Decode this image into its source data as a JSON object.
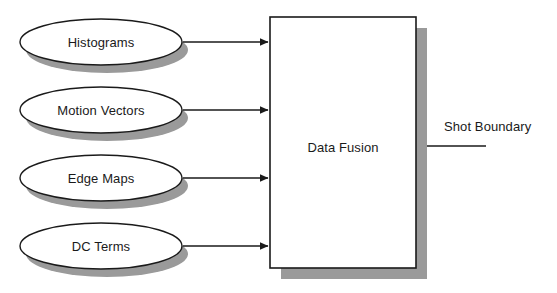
{
  "diagram": {
    "type": "flow-diagram",
    "background_color": "#ffffff",
    "stroke_color": "#1a1a1a",
    "shadow_color": "#9a9a9a",
    "fill_color": "#ffffff",
    "inputs": [
      {
        "id": "histograms",
        "label": "Histograms",
        "shape": "ellipse",
        "cx": 101,
        "cy": 42,
        "rx": 81,
        "ry": 23
      },
      {
        "id": "motion-vectors",
        "label": "Motion Vectors",
        "shape": "ellipse",
        "cx": 101,
        "cy": 110,
        "rx": 81,
        "ry": 23
      },
      {
        "id": "edge-maps",
        "label": "Edge Maps",
        "shape": "ellipse",
        "cx": 101,
        "cy": 178,
        "rx": 81,
        "ry": 23
      },
      {
        "id": "dc-terms",
        "label": "DC Terms",
        "shape": "ellipse",
        "cx": 101,
        "cy": 246,
        "rx": 81,
        "ry": 23
      }
    ],
    "process": {
      "id": "data-fusion",
      "label": "Data Fusion",
      "shape": "rectangle",
      "x": 270,
      "y": 17,
      "width": 146,
      "height": 251,
      "label_cx": 343,
      "label_cy": 147
    },
    "arrows": [
      {
        "id": "arrow-histograms",
        "from": "histograms",
        "to": "data-fusion",
        "x1": 183,
        "x2": 268,
        "y": 42
      },
      {
        "id": "arrow-motion-vectors",
        "from": "motion-vectors",
        "to": "data-fusion",
        "x1": 183,
        "x2": 268,
        "y": 110
      },
      {
        "id": "arrow-edge-maps",
        "from": "edge-maps",
        "to": "data-fusion",
        "x1": 183,
        "x2": 268,
        "y": 178
      },
      {
        "id": "arrow-dc-terms",
        "from": "dc-terms",
        "to": "data-fusion",
        "x1": 183,
        "x2": 268,
        "y": 246
      }
    ],
    "output": {
      "id": "shot-boundary",
      "label": "Shot Boundary",
      "line_x1": 427,
      "line_x2": 486,
      "line_y": 146,
      "label_x": 444,
      "label_y": 126
    }
  }
}
